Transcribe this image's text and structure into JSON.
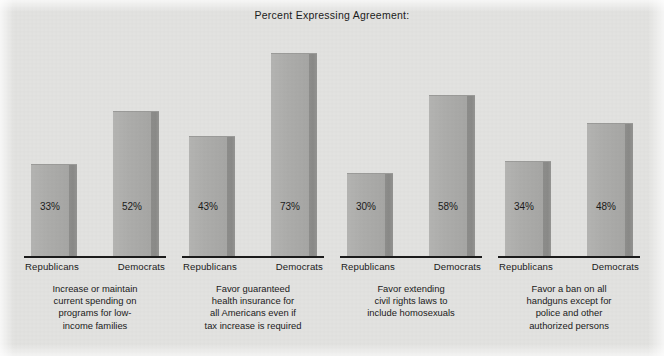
{
  "chart_data": {
    "type": "bar",
    "title": "Percent Expressing Agreement:",
    "xlabel": "",
    "ylabel": "",
    "ylim": [
      0,
      100
    ],
    "grid": false,
    "legend_position": "none",
    "categories": [
      "Increase or maintain current spending on programs for low-income families",
      "Favor guaranteed health insurance for all Americans even if tax increase is required",
      "Favor extending civil rights laws to include homosexuals",
      "Favor a ban on all handguns except for police and other authorized persons"
    ],
    "series": [
      {
        "name": "Republicans",
        "values": [
          33,
          43,
          30,
          34
        ]
      },
      {
        "name": "Democrats",
        "values": [
          52,
          73,
          58,
          48
        ]
      }
    ],
    "value_suffix": "%",
    "colors": {
      "background": "#e2e2e0",
      "bar_face": "#adadab",
      "bar_side": "#8a8a88",
      "text": "#1b1b1b",
      "axis": "#1b1b1b"
    }
  },
  "groups": [
    {
      "caption_lines": [
        "Increase or maintain",
        "current spending on",
        "programs for low-",
        "income families"
      ],
      "bars": [
        {
          "series": "Republicans",
          "value": 33,
          "label": "33%"
        },
        {
          "series": "Democrats",
          "value": 52,
          "label": "52%"
        }
      ]
    },
    {
      "caption_lines": [
        "Favor guaranteed",
        "health insurance for",
        "all Americans even if",
        "tax increase is required"
      ],
      "bars": [
        {
          "series": "Republicans",
          "value": 43,
          "label": "43%"
        },
        {
          "series": "Democrats",
          "value": 73,
          "label": "73%"
        }
      ]
    },
    {
      "caption_lines": [
        "Favor extending",
        "civil rights laws to",
        "include homosexuals"
      ],
      "bars": [
        {
          "series": "Republicans",
          "value": 30,
          "label": "30%"
        },
        {
          "series": "Democrats",
          "value": 58,
          "label": "58%"
        }
      ]
    },
    {
      "caption_lines": [
        "Favor a ban on all",
        "handguns except for",
        "police and other",
        "authorized persons"
      ],
      "bars": [
        {
          "series": "Republicans",
          "value": 34,
          "label": "34%"
        },
        {
          "series": "Democrats",
          "value": 48,
          "label": "48%"
        }
      ]
    }
  ]
}
